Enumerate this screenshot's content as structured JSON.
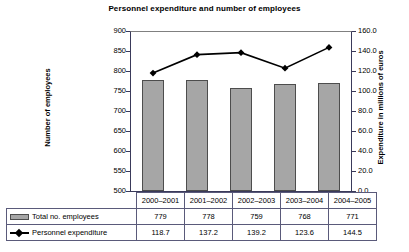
{
  "chart_data": {
    "type": "bar",
    "title": "Personnel expenditure and number of employees",
    "categories": [
      "2000–2001",
      "2001–2002",
      "2002–2003",
      "2003–2004",
      "2004–2005"
    ],
    "series": [
      {
        "name": "Total no. employees",
        "type": "bar",
        "axis": "left",
        "values": [
          779,
          778,
          759,
          768,
          771
        ],
        "color": "#a6a6a6"
      },
      {
        "name": "Personnel expenditure",
        "type": "line",
        "axis": "right",
        "values": [
          118.7,
          137.2,
          139.2,
          123.6,
          144.5
        ],
        "color": "#000000",
        "marker": "diamond"
      }
    ],
    "xlabel": "",
    "ylabel": "Number of employees",
    "y2label": "Expenditure in millions of euros",
    "ylim": [
      500,
      900
    ],
    "y2lim": [
      0,
      160
    ],
    "yticks": [
      "900",
      "850",
      "800",
      "750",
      "700",
      "650",
      "600",
      "550",
      "500"
    ],
    "y2ticks": [
      "160.0",
      "140.0",
      "120.0",
      "100.0",
      "80.0",
      "60.0",
      "40.0",
      "20.0",
      "0.0"
    ],
    "grid": false,
    "legend_position": "bottom-table"
  },
  "axes": {
    "left_title": "Number of employees",
    "right_title": "Expenditure in millions of euros"
  },
  "table": {
    "years": [
      "2000–2001",
      "2001–2002",
      "2002–2003",
      "2003–2004",
      "2004–2005"
    ],
    "rows": [
      {
        "label": "Total no. employees",
        "values": [
          "779",
          "778",
          "759",
          "768",
          "771"
        ]
      },
      {
        "label": "Personnel expenditure",
        "values": [
          "118.7",
          "137.2",
          "139.2",
          "123.6",
          "144.5"
        ]
      }
    ]
  }
}
